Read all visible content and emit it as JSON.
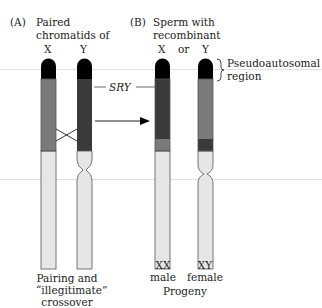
{
  "panel_a": {
    "label": "(A)",
    "title_line1": "Paired",
    "title_line2": "chromatids of",
    "chrom_labels": [
      "X",
      "Y"
    ],
    "caption_line1": "Pairing and",
    "caption_line2": "“illegitimate”",
    "caption_line3": "crossover"
  },
  "panel_b": {
    "label": "(B)",
    "title_line1": "Sperm with",
    "title_line2": "recombinant",
    "chrom_labels": [
      "X",
      "or",
      "Y"
    ],
    "pseudo_line1": "Pseudoautosomal",
    "pseudo_line2": "region",
    "progeny": [
      {
        "line1": "XX",
        "line2": "male"
      },
      {
        "line1": "XY",
        "line2": "female"
      }
    ],
    "progeny_label": "Progeny"
  },
  "sry_label": "SRY",
  "colors": {
    "pseudoautosomal": "#000000",
    "x_specific": "#7a7a7a",
    "y_specific": "#3a3a3a",
    "lower_arm": "#e6e6e6",
    "outline": "#555555"
  }
}
